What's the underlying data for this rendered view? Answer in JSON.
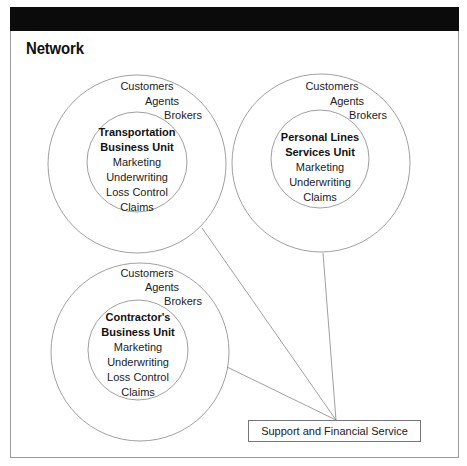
{
  "header": {
    "title": "Network"
  },
  "colors": {
    "top_bar": "#0b0b0b",
    "stroke": "#888888",
    "text": "#222222"
  },
  "units": [
    {
      "id": "transportation",
      "outer_labels": [
        "Customers",
        "Agents",
        "Brokers"
      ],
      "name_lines": [
        "Transportation",
        "Business Unit"
      ],
      "functions": [
        "Marketing",
        "Underwriting",
        "Loss Control",
        "Claims"
      ]
    },
    {
      "id": "personal-lines",
      "outer_labels": [
        "Customers",
        "Agents",
        "Brokers"
      ],
      "name_lines": [
        "Personal Lines",
        "Services Unit"
      ],
      "functions": [
        "Marketing",
        "Underwriting",
        "Claims"
      ]
    },
    {
      "id": "contractors",
      "outer_labels": [
        "Customers",
        "Agents",
        "Brokers"
      ],
      "name_lines": [
        "Contractor's",
        "Business Unit"
      ],
      "functions": [
        "Marketing",
        "Underwriting",
        "Loss Control",
        "Claims"
      ]
    }
  ],
  "hub": {
    "label": "Support and Financial Service"
  },
  "connections": [
    {
      "from": "transportation",
      "to": "hub"
    },
    {
      "from": "personal-lines",
      "to": "hub"
    },
    {
      "from": "contractors",
      "to": "hub"
    }
  ]
}
